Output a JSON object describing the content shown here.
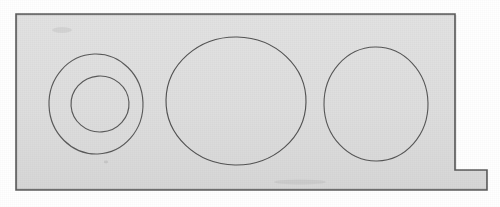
{
  "scene": {
    "title": "Hand-drawn geometric sketch",
    "description": "Pencil sketch on light gray paper: an L-shaped / notched rectangular outline containing three circles drawn in a row, the leftmost being a pair of concentric circles (an annulus).",
    "medium": "pencil-on-paper",
    "canvas": {
      "width": 500,
      "height": 207
    },
    "colors": {
      "page_background": "#ffffff",
      "paper_fill": "#dedede",
      "paper_fill_shadow": "#d6d6d6",
      "ink_stroke": "#4a4a4a",
      "ink_stroke_light": "#6e6e6e",
      "border_stroke": "#3a3a3a"
    },
    "stroke_widths": {
      "border": 1.6,
      "circle": 1.1
    }
  },
  "frame": {
    "name": "notched-rectangle-outline",
    "shape": "rectangle-with-bottom-right-step",
    "points": [
      [
        16,
        14
      ],
      [
        455,
        14
      ],
      [
        455,
        170
      ],
      [
        487,
        170
      ],
      [
        487,
        190
      ],
      [
        16,
        190
      ]
    ],
    "notes": "Main body spans x 16-455, y 14-190. A step extends the bottom band rightwards to x 487 between y 170 and y 190."
  },
  "shapes": [
    {
      "id": "circle-outer-left",
      "name": "outer-circle-left",
      "type": "ellipse",
      "cx": 96,
      "cy": 104,
      "rx": 47,
      "ry": 50,
      "rotation": -2,
      "label": "Outer circle of concentric pair"
    },
    {
      "id": "circle-inner-left",
      "name": "inner-circle-left",
      "type": "ellipse",
      "cx": 100,
      "cy": 104,
      "rx": 29,
      "ry": 28,
      "rotation": -4,
      "label": "Inner circle of concentric pair"
    },
    {
      "id": "circle-middle",
      "name": "middle-circle",
      "type": "ellipse",
      "cx": 236,
      "cy": 101,
      "rx": 70,
      "ry": 64,
      "rotation": 1,
      "label": "Large middle circle"
    },
    {
      "id": "circle-right",
      "name": "right-circle",
      "type": "ellipse",
      "cx": 376,
      "cy": 104,
      "rx": 52,
      "ry": 57,
      "rotation": -1,
      "label": "Right circle"
    }
  ],
  "counts": {
    "circles_total": 4,
    "circle_groups": 3,
    "concentric_pairs": 1
  }
}
